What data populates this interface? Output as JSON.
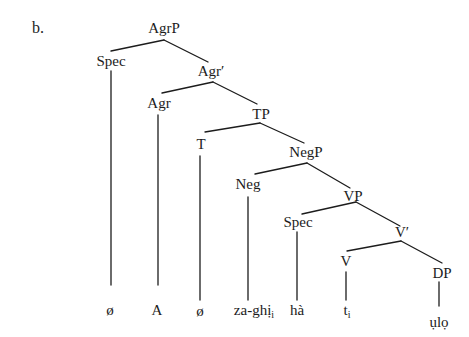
{
  "example_label": "b.",
  "colors": {
    "background": "#ffffff",
    "ink": "#1c1c1c"
  },
  "nodes": {
    "agrp": "AgrP",
    "spec_agr": "Spec",
    "agr_bar": "Agr′",
    "agr": "Agr",
    "tp": "TP",
    "t": "T",
    "negp": "NegP",
    "neg": "Neg",
    "vp": "VP",
    "spec_v": "Spec",
    "v_bar": "V′",
    "v": "V",
    "dp": "DP"
  },
  "terminals": {
    "spec_agr": "ø",
    "agr": "A",
    "t": "ø",
    "neg_base": "za-ghị",
    "neg_sub": "i",
    "spec_v": "hà",
    "v_base": "t",
    "v_sub": "i",
    "dp": "ụlọ"
  }
}
